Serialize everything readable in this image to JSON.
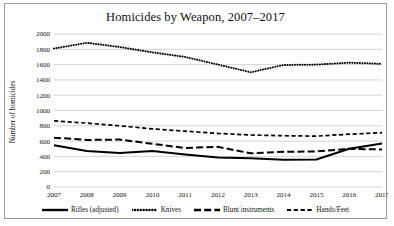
{
  "chart_data": {
    "type": "line",
    "title": "Homicides by Weapon, 2007–2017",
    "xlabel": "",
    "ylabel": "Number of homicides",
    "categories": [
      "2007",
      "2008",
      "2009",
      "2010",
      "2011",
      "2012",
      "2013",
      "2014",
      "2015",
      "2016",
      "2017"
    ],
    "x": [
      2007,
      2008,
      2009,
      2010,
      2011,
      2012,
      2013,
      2014,
      2015,
      2016,
      2017
    ],
    "ylim": [
      0,
      2000
    ],
    "ytick_labels": [
      "0",
      "200",
      "400",
      "600",
      "800",
      "1000",
      "1200",
      "1400",
      "1600",
      "1800",
      "2000"
    ],
    "yticks": [
      0,
      200,
      400,
      600,
      800,
      1000,
      1200,
      1400,
      1600,
      1800,
      2000
    ],
    "grid": true,
    "legend_position": "bottom",
    "series": [
      {
        "name": "Rifles (adjusted)",
        "style": "solid",
        "color": "#000000",
        "values": [
          545,
          470,
          445,
          470,
          425,
          385,
          375,
          355,
          360,
          500,
          570
        ]
      },
      {
        "name": "Knives",
        "style": "dotted",
        "color": "#000000",
        "values": [
          1810,
          1885,
          1830,
          1760,
          1700,
          1600,
          1500,
          1595,
          1600,
          1625,
          1610
        ]
      },
      {
        "name": "Blunt instruments",
        "style": "long-dash",
        "color": "#000000",
        "values": [
          645,
          615,
          620,
          565,
          510,
          525,
          440,
          460,
          465,
          500,
          490
        ]
      },
      {
        "name": "Hands/Feet",
        "style": "dash",
        "color": "#000000",
        "values": [
          865,
          835,
          800,
          760,
          730,
          700,
          680,
          670,
          665,
          690,
          710
        ]
      }
    ]
  },
  "legend": {
    "items": [
      {
        "label": "Rifles (adjusted)",
        "style": "solid"
      },
      {
        "label": "Knives",
        "style": "dotted"
      },
      {
        "label": "Blunt instruments",
        "style": "long-dash"
      },
      {
        "label": "Hands/Feet",
        "style": "dash"
      }
    ]
  },
  "colors": {
    "frame_border": "#9a9a9a",
    "gridline": "#c9c9c9",
    "series": "#000000",
    "background": "#ffffff",
    "text": "#111111"
  }
}
